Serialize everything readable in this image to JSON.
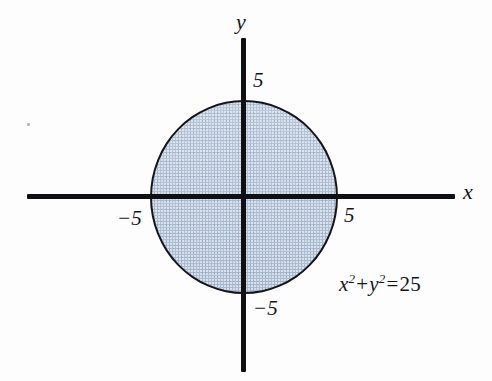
{
  "figure": {
    "background_color": "#fdfdfd",
    "ink_color": "#15151b",
    "fill_color": "#b3c3d7"
  },
  "axes": {
    "x_label": "x",
    "y_label": "y",
    "ticks": {
      "x_negative": "−5",
      "x_positive": "5",
      "y_positive": "5",
      "y_negative": "−5"
    }
  },
  "annotation": {
    "variable_x": "x",
    "exponent_x": "2",
    "plus": "+",
    "variable_y": "y",
    "exponent_y": "2",
    "equals": "=",
    "value": "25",
    "full_text": "x² + y² = 25"
  },
  "chart_data": {
    "type": "scatter",
    "title": "",
    "subtitle": "",
    "xlabel": "x",
    "ylabel": "y",
    "xlim": [
      -11.5,
      11.5
    ],
    "ylim": [
      -9,
      8.5
    ],
    "grid": false,
    "legend": null,
    "shapes": [
      {
        "kind": "circle",
        "equation": "x² + y² = 25",
        "center": [
          0,
          0
        ],
        "radius": 5,
        "filled": true,
        "fill_color": "#b3c3d7",
        "edge_color": "#15151b",
        "label": "x² + y² = 25"
      }
    ],
    "annotations": [
      {
        "text": "x² + y² = 25",
        "x": 7.5,
        "y": -4.2
      }
    ],
    "xticks": [
      -5,
      5
    ],
    "xticklabels": [
      "−5",
      "5"
    ],
    "yticks": [
      -5,
      5
    ],
    "yticklabels": [
      "−5",
      "5"
    ]
  }
}
